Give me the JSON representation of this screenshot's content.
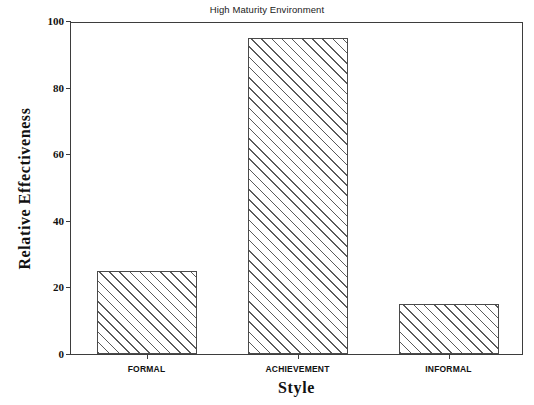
{
  "chart_data": {
    "type": "bar",
    "title": "High Maturity Environment",
    "xlabel": "Style",
    "ylabel": "Relative Effectiveness",
    "categories": [
      "FORMAL",
      "ACHIEVEMENT",
      "INFORMAL"
    ],
    "values": [
      25,
      95,
      15
    ],
    "ylim": [
      0,
      100
    ],
    "yticks": [
      0,
      20,
      40,
      60,
      80,
      100
    ],
    "ytick_labels": [
      "0",
      "20",
      "40",
      "60",
      "80",
      "100"
    ],
    "grid": false,
    "legend": null,
    "bar_style": {
      "fill": "#ffffff",
      "hatch": "diagonal-forward-slash",
      "edge_color": "#4a4a4a"
    },
    "frame_color": "#3d3d3d",
    "text_color": "#111111"
  }
}
